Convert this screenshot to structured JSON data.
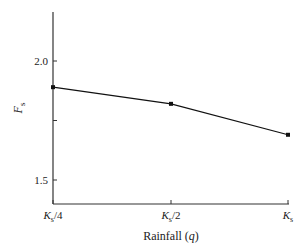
{
  "chart_data": {
    "type": "line",
    "title": "",
    "xlabel": "Rainfall (q)",
    "xlabel_parts": {
      "text": "Rainfall (",
      "var": "q",
      "close": ")"
    },
    "ylabel": "Fs",
    "ylabel_parts": {
      "main": "F",
      "sub": "s"
    },
    "categories": [
      "Ks/4",
      "Ks/2",
      "Ks"
    ],
    "category_parts": [
      {
        "main": "K",
        "sub": "s",
        "suffix": "/4"
      },
      {
        "main": "K",
        "sub": "s",
        "suffix": "/2"
      },
      {
        "main": "K",
        "sub": "s",
        "suffix": ""
      }
    ],
    "series": [
      {
        "name": "Fs",
        "values": [
          1.89,
          1.82,
          1.69
        ],
        "marker": "square",
        "color": "#111111"
      }
    ],
    "ylim": [
      1.4,
      2.2
    ],
    "yticks": [
      1.5,
      1.75,
      2.0
    ],
    "ytick_labels": [
      "1.5",
      "",
      "2.0"
    ],
    "grid": false,
    "legend": null
  }
}
